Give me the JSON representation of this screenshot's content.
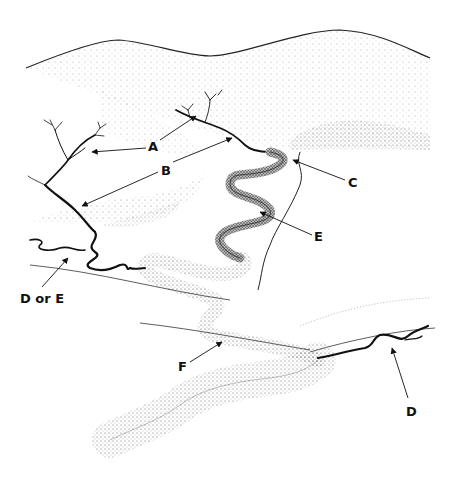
{
  "figure": {
    "colors": {
      "ink": "#111111",
      "stipple": "#555555",
      "background": "#ffffff"
    }
  },
  "labels": [
    {
      "id": "A",
      "text": "A",
      "x": 148,
      "y": 140
    },
    {
      "id": "B",
      "text": "B",
      "x": 161,
      "y": 164
    },
    {
      "id": "C",
      "text": "C",
      "x": 348,
      "y": 176
    },
    {
      "id": "E",
      "text": "E",
      "x": 314,
      "y": 230
    },
    {
      "id": "D_or_E",
      "text": "D or E",
      "x": 20,
      "y": 292
    },
    {
      "id": "F",
      "text": "F",
      "x": 178,
      "y": 360
    },
    {
      "id": "D",
      "text": "D",
      "x": 406,
      "y": 405
    }
  ]
}
